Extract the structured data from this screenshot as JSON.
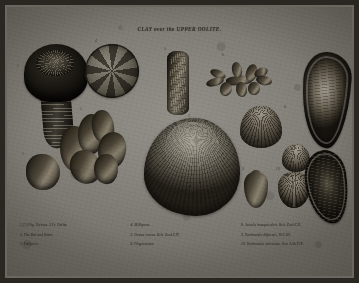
{
  "plate": {
    "title": "CLAY over the UPPER OOLITE.",
    "medium": "engraving",
    "paper_color": "#8a8780",
    "ink_color": "#2a2620",
    "border_color": "#2a2722"
  },
  "figure_numbers": {
    "n1": "1.",
    "n2": "2.",
    "n3": "3.",
    "n4": "4.",
    "n5": "5.",
    "n6": "6.",
    "n7": "7.",
    "n8": "8.",
    "n9": "9.",
    "n10": "10."
  },
  "captions": {
    "column_1": [
      "1,2,3.Fig. Tortosa. 3.Fr. Oolite.",
      "2. The Bed and Stone.",
      "3. Tubipora."
    ],
    "column_2": [
      "4. Millepora.",
      "5. Ostrea crassa. Brit. Zool.T.IV.",
      "6. Plagiostoma."
    ],
    "column_3": [
      "8. Avicula inaequivalvis. Brit. Zool.T.II.",
      "9. Terebratula difformis. W.C.III.",
      "10. Terebratula reticulata. Sow. Lith.T.IX."
    ]
  },
  "specimens": [
    {
      "id": "tube",
      "name": "tubular-coral",
      "label": "1"
    },
    {
      "id": "knob",
      "name": "knobby-coral-mass",
      "label": "2"
    },
    {
      "id": "lump",
      "name": "rock-lump",
      "label": "3"
    },
    {
      "id": "disc",
      "name": "radiating-disc",
      "label": "4"
    },
    {
      "id": "rod",
      "name": "elongate-ribbed-fossil",
      "label": "5"
    },
    {
      "id": "branch",
      "name": "branching-coral",
      "label": "6"
    },
    {
      "id": "bivalve",
      "name": "large-bivalve",
      "label": "7"
    },
    {
      "id": "pecten",
      "name": "scallop-shell",
      "label": "8"
    },
    {
      "id": "pecten2",
      "name": "small-scallop-shell",
      "label": "9"
    },
    {
      "id": "tere",
      "name": "smooth-brachiopod",
      "label": "9"
    },
    {
      "id": "brach",
      "name": "ribbed-brachiopod",
      "label": "10"
    },
    {
      "id": "oyster",
      "name": "large-oyster-shell",
      "label": "8"
    },
    {
      "id": "ostrea",
      "name": "dark-oyster-shell",
      "label": "10"
    }
  ]
}
